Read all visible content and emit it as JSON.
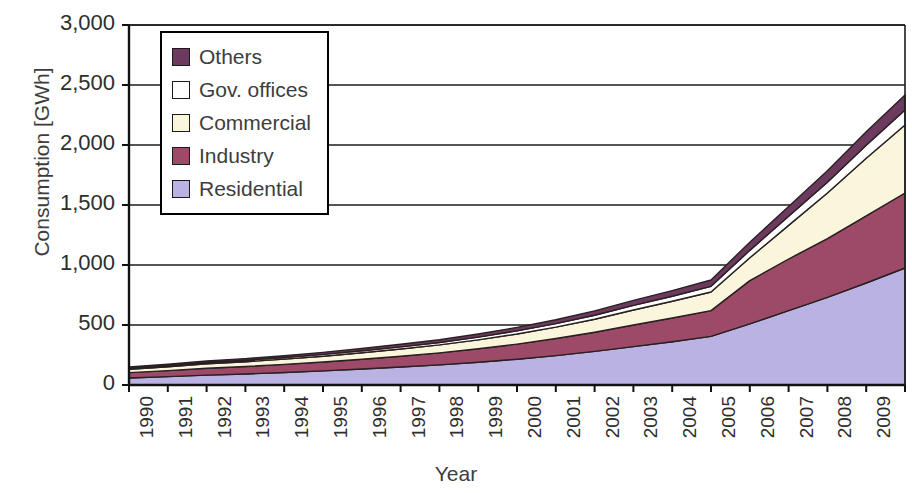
{
  "chart_data": {
    "type": "area",
    "stacked": true,
    "title": "",
    "xlabel": "Year",
    "ylabel": "Consumption [GWh]",
    "ylim": [
      0,
      3000
    ],
    "ytick_labels": [
      "3,000",
      "2,500",
      "2,000",
      "1,500",
      "1,000",
      "500",
      "0"
    ],
    "ytick_values": [
      3000,
      2500,
      2000,
      1500,
      1000,
      500,
      0
    ],
    "grid": true,
    "grid_axis": "y",
    "legend_position": "upper-left-inside",
    "legend_order_top_to_bottom": [
      "Others",
      "Gov. offices",
      "Commercial",
      "Industry",
      "Residential"
    ],
    "categories": [
      "1990",
      "1991",
      "1992",
      "1993",
      "1994",
      "1995",
      "1996",
      "1997",
      "1998",
      "1999",
      "2000",
      "2001",
      "2002",
      "2003",
      "2004",
      "2005",
      "2006",
      "2007",
      "2008",
      "2009",
      "2010"
    ],
    "series": [
      {
        "name": "Residential",
        "color": "#b9b2e3",
        "values": [
          58,
          70,
          82,
          92,
          104,
          118,
          133,
          150,
          168,
          190,
          215,
          245,
          280,
          320,
          360,
          405,
          510,
          620,
          730,
          850,
          975
        ]
      },
      {
        "name": "Industry",
        "color": "#9d4a69",
        "values": [
          45,
          50,
          58,
          62,
          68,
          74,
          82,
          90,
          100,
          112,
          126,
          142,
          160,
          180,
          198,
          215,
          360,
          430,
          490,
          560,
          625
        ]
      },
      {
        "name": "Commercial",
        "color": "#faf6dc",
        "values": [
          28,
          32,
          36,
          40,
          44,
          48,
          54,
          60,
          66,
          74,
          84,
          95,
          108,
          125,
          140,
          155,
          190,
          280,
          380,
          480,
          567
        ]
      },
      {
        "name": "Gov. offices",
        "color": "#ffffff",
        "values": [
          9,
          10,
          11,
          12,
          13,
          15,
          16,
          18,
          20,
          23,
          26,
          29,
          33,
          38,
          42,
          47,
          62,
          76,
          90,
          108,
          125
        ]
      },
      {
        "name": "Others",
        "color": "#6b3a5e",
        "values": [
          10,
          11,
          13,
          14,
          15,
          17,
          19,
          21,
          23,
          26,
          29,
          33,
          37,
          42,
          47,
          53,
          68,
          82,
          95,
          112,
          125
        ]
      }
    ],
    "stacked_totals": [
      150,
      173,
      200,
      220,
      244,
      272,
      304,
      339,
      377,
      425,
      480,
      544,
      618,
      705,
      787,
      875,
      1190,
      1488,
      1785,
      2110,
      2417
    ]
  },
  "layout": {
    "plot_left": 129,
    "plot_right": 905,
    "plot_top": 25,
    "plot_bottom": 385
  },
  "axis_titles": {
    "y": "Consumption [GWh]",
    "x": "Year"
  }
}
